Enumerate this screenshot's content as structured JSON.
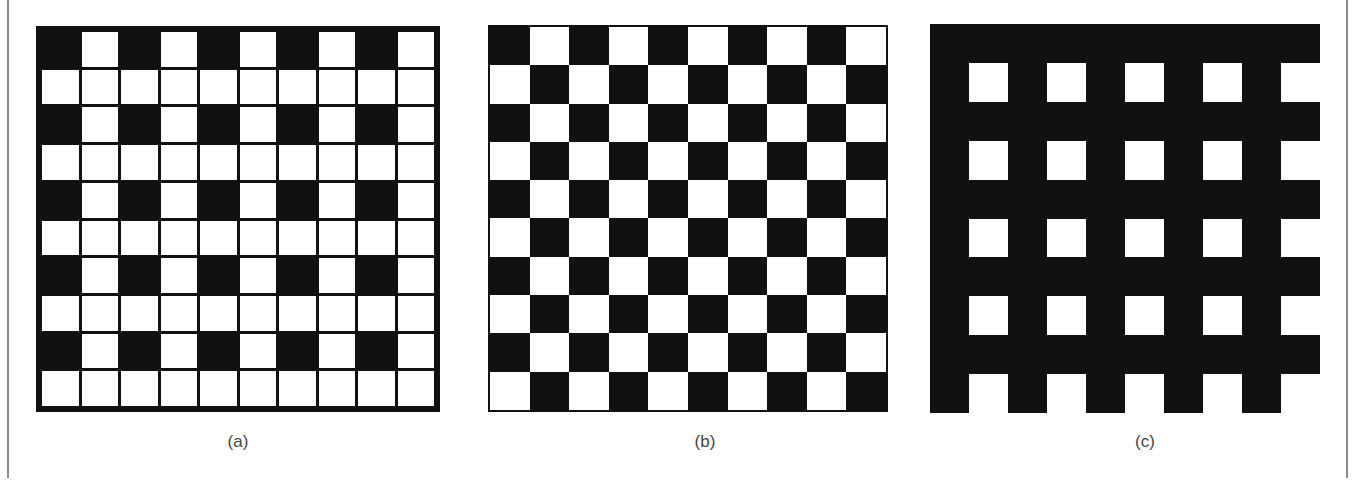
{
  "figure": {
    "background_color": "#ffffff",
    "rule_color": "#8a8a8a",
    "ink_color": "#111111",
    "caption_color": "#444444",
    "panels": [
      {
        "id": "a",
        "caption": "(a)",
        "caption_center_x": 238,
        "pattern_type": "sparse-grid",
        "rows": 10,
        "cols": 10,
        "description": "10x10 lattice, black squares at odd rows and odd columns only",
        "left": 36,
        "top": 26,
        "width": 404,
        "height": 386,
        "grid": [
          [
            1,
            0,
            1,
            0,
            1,
            0,
            1,
            0,
            1,
            0
          ],
          [
            0,
            0,
            0,
            0,
            0,
            0,
            0,
            0,
            0,
            0
          ],
          [
            1,
            0,
            1,
            0,
            1,
            0,
            1,
            0,
            1,
            0
          ],
          [
            0,
            0,
            0,
            0,
            0,
            0,
            0,
            0,
            0,
            0
          ],
          [
            1,
            0,
            1,
            0,
            1,
            0,
            1,
            0,
            1,
            0
          ],
          [
            0,
            0,
            0,
            0,
            0,
            0,
            0,
            0,
            0,
            0
          ],
          [
            1,
            0,
            1,
            0,
            1,
            0,
            1,
            0,
            1,
            0
          ],
          [
            0,
            0,
            0,
            0,
            0,
            0,
            0,
            0,
            0,
            0
          ],
          [
            1,
            0,
            1,
            0,
            1,
            0,
            1,
            0,
            1,
            0
          ],
          [
            0,
            0,
            0,
            0,
            0,
            0,
            0,
            0,
            0,
            0
          ]
        ]
      },
      {
        "id": "b",
        "caption": "(b)",
        "caption_center_x": 705,
        "pattern_type": "checkerboard",
        "rows": 10,
        "cols": 10,
        "description": "10x10 standard alternating checkerboard",
        "left": 488,
        "top": 25,
        "width": 400,
        "height": 387,
        "grid": [
          [
            1,
            0,
            1,
            0,
            1,
            0,
            1,
            0,
            1,
            0
          ],
          [
            0,
            1,
            0,
            1,
            0,
            1,
            0,
            1,
            0,
            1
          ],
          [
            1,
            0,
            1,
            0,
            1,
            0,
            1,
            0,
            1,
            0
          ],
          [
            0,
            1,
            0,
            1,
            0,
            1,
            0,
            1,
            0,
            1
          ],
          [
            1,
            0,
            1,
            0,
            1,
            0,
            1,
            0,
            1,
            0
          ],
          [
            0,
            1,
            0,
            1,
            0,
            1,
            0,
            1,
            0,
            1
          ],
          [
            1,
            0,
            1,
            0,
            1,
            0,
            1,
            0,
            1,
            0
          ],
          [
            0,
            1,
            0,
            1,
            0,
            1,
            0,
            1,
            0,
            1
          ],
          [
            1,
            0,
            1,
            0,
            1,
            0,
            1,
            0,
            1,
            0
          ],
          [
            0,
            1,
            0,
            1,
            0,
            1,
            0,
            1,
            0,
            1
          ]
        ]
      },
      {
        "id": "c",
        "caption": "(c)",
        "caption_center_x": 1145,
        "pattern_type": "inverse-sparse-grid",
        "rows": 10,
        "cols": 10,
        "description": "solid black field with 5x5 white squares at even rows and even columns",
        "left": 930,
        "top": 24,
        "width": 390,
        "height": 389,
        "grid": [
          [
            0,
            0,
            0,
            0,
            0,
            0,
            0,
            0,
            0,
            0
          ],
          [
            0,
            1,
            0,
            1,
            0,
            1,
            0,
            1,
            0,
            1
          ],
          [
            0,
            0,
            0,
            0,
            0,
            0,
            0,
            0,
            0,
            0
          ],
          [
            0,
            1,
            0,
            1,
            0,
            1,
            0,
            1,
            0,
            1
          ],
          [
            0,
            0,
            0,
            0,
            0,
            0,
            0,
            0,
            0,
            0
          ],
          [
            0,
            1,
            0,
            1,
            0,
            1,
            0,
            1,
            0,
            1
          ],
          [
            0,
            0,
            0,
            0,
            0,
            0,
            0,
            0,
            0,
            0
          ],
          [
            0,
            1,
            0,
            1,
            0,
            1,
            0,
            1,
            0,
            1
          ],
          [
            0,
            0,
            0,
            0,
            0,
            0,
            0,
            0,
            0,
            0
          ],
          [
            0,
            1,
            0,
            1,
            0,
            1,
            0,
            1,
            0,
            1
          ]
        ]
      }
    ],
    "caption_top": 432
  }
}
